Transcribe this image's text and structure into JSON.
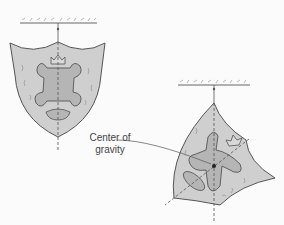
{
  "diagram": {
    "type": "physics-illustration",
    "figures": [
      {
        "name": "shield-hanging-upright",
        "description": "Shield hanging from a ceiling by a string; dashed vertical line passes through pivot"
      },
      {
        "name": "shield-hanging-rotated",
        "description": "Shield suspended from a different point; two dashed lines intersect at center of gravity"
      }
    ],
    "annotation": {
      "line1": "Center of",
      "line2": "gravity"
    },
    "colors": {
      "shield_fill": "#cfcfcf",
      "emblem_fill": "#b5b5b5",
      "stroke": "#555555",
      "ceiling": "#888888"
    }
  }
}
